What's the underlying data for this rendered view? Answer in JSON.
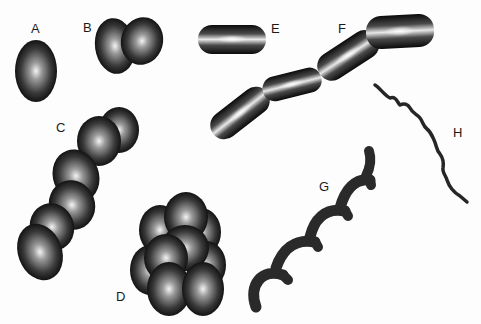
{
  "figure": {
    "labels": [
      {
        "id": "A",
        "text": "A",
        "x": 31,
        "y": 22,
        "shape": "single coccus"
      },
      {
        "id": "B",
        "text": "B",
        "x": 83,
        "y": 21,
        "shape": "diplococcus"
      },
      {
        "id": "C",
        "text": "C",
        "x": 56,
        "y": 121,
        "shape": "streptococcus chain"
      },
      {
        "id": "D",
        "text": "D",
        "x": 116,
        "y": 290,
        "shape": "staphylococcus cluster"
      },
      {
        "id": "E",
        "text": "E",
        "x": 271,
        "y": 22,
        "shape": "single bacillus"
      },
      {
        "id": "F",
        "text": "F",
        "x": 338,
        "y": 22,
        "shape": "streptobacillus chain"
      },
      {
        "id": "G",
        "text": "G",
        "x": 319,
        "y": 180,
        "shape": "spirillum"
      },
      {
        "id": "H",
        "text": "H",
        "x": 453,
        "y": 126,
        "shape": "spirochete"
      }
    ]
  }
}
